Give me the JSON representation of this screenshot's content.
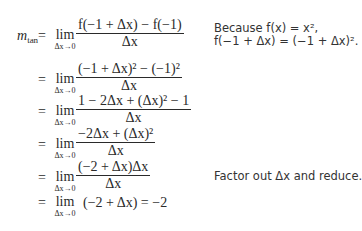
{
  "derivation": {
    "lhs": {
      "symbol": "m",
      "subscript": "tan"
    },
    "equals": "=",
    "lim_word": "lim",
    "lim_sub": "Δx→0",
    "steps": [
      {
        "num": "f(−1 + Δx) − f(−1)",
        "den": "Δx"
      },
      {
        "num": "(−1 + Δx)² − (−1)²",
        "den": "Δx"
      },
      {
        "num": "1 − 2Δx + (Δx)² − 1",
        "den": "Δx"
      },
      {
        "num": "−2Δx + (Δx)²",
        "den": "Δx"
      },
      {
        "num": "(−2 + Δx)Δx",
        "den": "Δx"
      },
      {
        "expr": "(−2 + Δx) = −2"
      }
    ]
  },
  "annotations": {
    "note1_line1": "Because f(x) = x²,",
    "note1_line2": "f(−1 + Δx) = (−1 + Δx)².",
    "note2": "Factor out Δx and reduce."
  }
}
